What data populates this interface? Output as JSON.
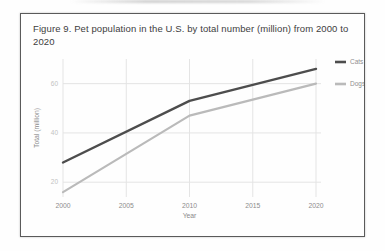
{
  "figure": {
    "title": "Figure 9. Pet population in the U.S. by total number (million) from 2000 to 2020"
  },
  "chart_data": {
    "type": "line",
    "title": "Figure 9. Pet population in the U.S. by total number (million) from 2000 to 2020",
    "xlabel": "Year",
    "ylabel": "Total  (million)",
    "x": [
      2000,
      2010,
      2020
    ],
    "series": [
      {
        "name": "Cats",
        "values": [
          28,
          53,
          66
        ],
        "color": "#4d4d4d",
        "width": 2.4
      },
      {
        "name": "Dogs",
        "values": [
          16,
          47,
          60
        ],
        "color": "#bababa",
        "width": 2.2
      }
    ],
    "x_ticks": [
      2000,
      2005,
      2010,
      2015,
      2020
    ],
    "y_ticks": [
      20,
      40,
      60
    ],
    "xlim": [
      2000,
      2020
    ],
    "ylim": [
      14,
      70
    ],
    "grid": true,
    "legend_position": "right"
  },
  "colors": {
    "grid_line": "#e4e4e4",
    "y_tick_label": "#c2c2c2",
    "x_tick_label": "#8d8d8d",
    "axis_label": "#8a8a8a",
    "legend_label": "#8f8f8f",
    "title_text": "#3d3d3d",
    "figure_border": "#5a5a5a"
  }
}
